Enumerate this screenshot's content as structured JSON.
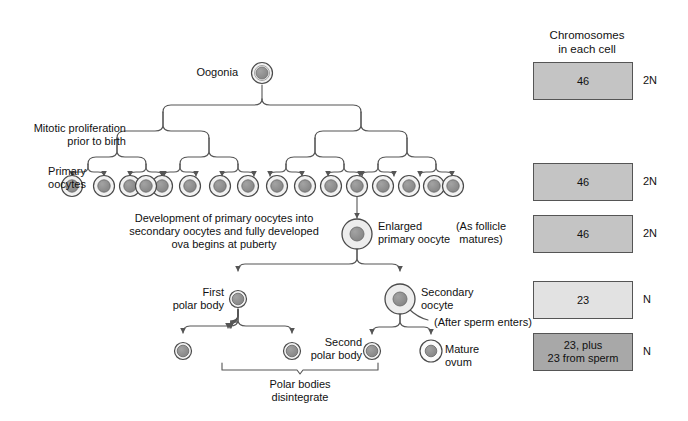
{
  "diagram": {
    "title_note": "Oogenesis diagram",
    "labels": {
      "oogonia": "Oogonia",
      "mitotic": "Mitotic proliferation\nprior to birth",
      "primary_oocytes": "Primary\noocytes",
      "development": "Development of primary oocytes into\nsecondary oocytes and fully developed\nova begins at puberty",
      "enlarged_primary_oocyte": "Enlarged\nprimary oocyte",
      "first_polar_body": "First\npolar body",
      "secondary_oocyte": "Secondary\noocyte",
      "after_sperm": "(After sperm enters)",
      "second_polar_body": "Second\npolar body",
      "mature_ovum": "Mature\novum",
      "polar_disintegrate": "Polar bodies\ndisintegrate",
      "as_follicle": "(As follicle\nmatures)"
    },
    "header": {
      "line1": "Chromosomes",
      "line2": "in each cell"
    },
    "chromosome_rows": [
      {
        "value": "46",
        "ploidy": "2N",
        "fill": "#c4c4c4"
      },
      {
        "value": "46",
        "ploidy": "2N",
        "fill": "#c4c4c4"
      },
      {
        "value": "46",
        "ploidy": "2N",
        "fill": "#c4c4c4"
      },
      {
        "value": "23",
        "ploidy": "N",
        "fill": "#e2e2e2"
      },
      {
        "value": "23, plus\n23 from sperm",
        "ploidy": "N",
        "fill": "#a8a8a8"
      }
    ],
    "colors": {
      "line": "#555555",
      "cell_outline": "#4a4a4a",
      "cell_nucleus": "#8f8f8f",
      "cell_cytoplasm": "#f2f2f2",
      "text": "#111111"
    },
    "counts": {
      "primary_oocytes": 16,
      "polar_bodies_bottom": 3
    }
  }
}
